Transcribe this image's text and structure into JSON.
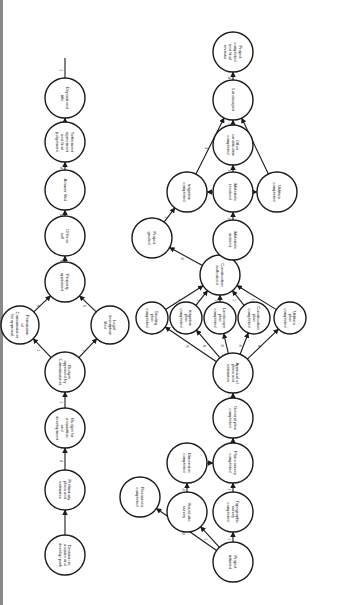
{
  "diagram": {
    "type": "pert-network",
    "orientation": "rotated-90",
    "colors": {
      "line": "#1a1a1a",
      "background": "#ffffff",
      "border": "#8a8a8a"
    },
    "acquisition_chain": {
      "nodes": [
        {
          "id": "a1",
          "label": "Decision to acquire and develop park"
        },
        {
          "id": "a2",
          "label": "Preliminary plans and estimates"
        },
        {
          "id": "a3",
          "label": "Budget for acquisition and development"
        },
        {
          "id": "a4",
          "label": "Budget approved by Commissioner"
        },
        {
          "id": "a5",
          "label": "Permission of Commissioner for approval"
        },
        {
          "id": "a6",
          "label": "Legal description filed"
        },
        {
          "id": "a7",
          "label": "Property appraised"
        },
        {
          "id": "a8",
          "label": "Offer to sell"
        },
        {
          "id": "a9",
          "label": "Answer filed"
        },
        {
          "id": "a10",
          "label": "Settlement agreement and final judgement"
        },
        {
          "id": "a11",
          "label": "Deposit and title"
        }
      ],
      "edges": [
        {
          "from": "a1",
          "to": "a2",
          "label": ""
        },
        {
          "from": "a2",
          "to": "a3",
          "label": "4"
        },
        {
          "from": "a3",
          "to": "a4",
          "label": "1"
        },
        {
          "from": "a4",
          "to": "a5",
          "label": "1"
        },
        {
          "from": "a4",
          "to": "a6",
          "label": "1"
        },
        {
          "from": "a5",
          "to": "a7",
          "label": "6"
        },
        {
          "from": "a6",
          "to": "a7",
          "label": "6"
        },
        {
          "from": "a7",
          "to": "a8",
          "label": "4"
        },
        {
          "from": "a8",
          "to": "a9",
          "label": "4"
        },
        {
          "from": "a9",
          "to": "a10",
          "label": "4"
        },
        {
          "from": "a10",
          "to": "a11",
          "label": "4"
        },
        {
          "from": "a11",
          "to": "end",
          "label": "1"
        }
      ]
    },
    "development_network": {
      "nodes": [
        {
          "id": "d1",
          "label": "Project initiated"
        },
        {
          "id": "d2",
          "label": "Topographic survey completed"
        },
        {
          "id": "d3",
          "label": "Plans survey completed"
        },
        {
          "id": "d4",
          "label": "General plan completed"
        },
        {
          "id": "d5",
          "label": "Visual site survey"
        },
        {
          "id": "d6",
          "label": "Dimension completed"
        },
        {
          "id": "d7",
          "label": "Resources completed"
        },
        {
          "id": "d8",
          "label": "Approval of plans and estimates"
        },
        {
          "id": "d9",
          "label": "Grading plan completed"
        },
        {
          "id": "d10",
          "label": "Irrigation plan completed"
        },
        {
          "id": "d11",
          "label": "Landscape plan completed"
        },
        {
          "id": "d12",
          "label": "Construction plan completed"
        },
        {
          "id": "d13",
          "label": "Utilities plan completed"
        },
        {
          "id": "d14",
          "label": "Construction authorized"
        },
        {
          "id": "d15",
          "label": "Project graded"
        },
        {
          "id": "d16",
          "label": "Materials ordered"
        },
        {
          "id": "d17",
          "label": "Irrigation completed"
        },
        {
          "id": "d18",
          "label": "Materials received"
        },
        {
          "id": "d19",
          "label": "Utilities completed"
        },
        {
          "id": "d20",
          "label": "Other construction completed"
        },
        {
          "id": "d21",
          "label": "Landscaped"
        },
        {
          "id": "d22",
          "label": "Project completed and final reviews"
        }
      ],
      "edges": [
        {
          "from": "d1",
          "to": "d2",
          "label": "1"
        },
        {
          "from": "d1",
          "to": "d5",
          "label": "1"
        },
        {
          "from": "d1",
          "to": "d7",
          "label": "22"
        },
        {
          "from": "d2",
          "to": "d3",
          "label": "1"
        },
        {
          "from": "d5",
          "to": "d6",
          "label": "4"
        },
        {
          "from": "d6",
          "to": "d3",
          "label": "4"
        },
        {
          "from": "d3",
          "to": "d4",
          "label": "12"
        },
        {
          "from": "d4",
          "to": "d8",
          "label": "4"
        },
        {
          "from": "d8",
          "to": "d9",
          "label": "8"
        },
        {
          "from": "d8",
          "to": "d10",
          "label": "8"
        },
        {
          "from": "d8",
          "to": "d11",
          "label": "8"
        },
        {
          "from": "d8",
          "to": "d12",
          "label": "8"
        },
        {
          "from": "d8",
          "to": "d13",
          "label": "8"
        },
        {
          "from": "d9",
          "to": "d14",
          "label": "1"
        },
        {
          "from": "d10",
          "to": "d14",
          "label": "1"
        },
        {
          "from": "d11",
          "to": "d14",
          "label": "1"
        },
        {
          "from": "d12",
          "to": "d14",
          "label": "1"
        },
        {
          "from": "d13",
          "to": "d14",
          "label": "1"
        },
        {
          "from": "d14",
          "to": "d15",
          "label": "8"
        },
        {
          "from": "d14",
          "to": "d16",
          "label": "4"
        },
        {
          "from": "d15",
          "to": "d17",
          "label": "1"
        },
        {
          "from": "d16",
          "to": "d18",
          "label": "16"
        },
        {
          "from": "d18",
          "to": "d17",
          "label": "4"
        },
        {
          "from": "d18",
          "to": "d19",
          "label": "4"
        },
        {
          "from": "d18",
          "to": "d20",
          "label": "12"
        },
        {
          "from": "d17",
          "to": "d21",
          "label": "3"
        },
        {
          "from": "d20",
          "to": "d21",
          "label": "4"
        },
        {
          "from": "d19",
          "to": "d21",
          "label": "13"
        },
        {
          "from": "d21",
          "to": "d22",
          "label": "4"
        }
      ]
    }
  }
}
